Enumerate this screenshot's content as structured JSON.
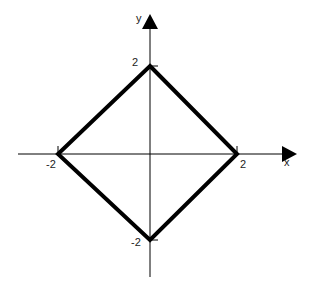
{
  "diagram": {
    "axes": {
      "x_label": "x",
      "y_label": "y",
      "color": "#000000"
    },
    "shape": {
      "type": "diamond",
      "vertices": [
        [
          0,
          2
        ],
        [
          2,
          0
        ],
        [
          0,
          -2
        ],
        [
          -2,
          0
        ]
      ],
      "stroke": "#000000"
    },
    "tick_labels": {
      "top": "2",
      "right": "2",
      "bottom": "-2",
      "left": "-2"
    }
  }
}
